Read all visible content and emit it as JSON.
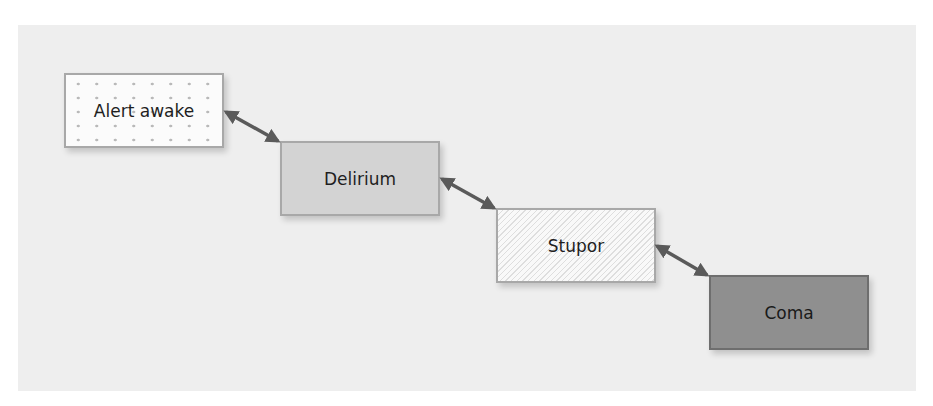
{
  "diagram": {
    "type": "sequential-states",
    "background_color": "#eeeeee",
    "arrow_color": "#5a5a5a",
    "arrow_style": "double-headed",
    "nodes": [
      {
        "id": "alert",
        "label": "Alert awake",
        "fill": "dotted-white"
      },
      {
        "id": "delirium",
        "label": "Delirium",
        "fill": "#d3d3d3"
      },
      {
        "id": "stupor",
        "label": "Stupor",
        "fill": "hatched-white"
      },
      {
        "id": "coma",
        "label": "Coma",
        "fill": "#8f8f8f"
      }
    ],
    "edges": [
      {
        "from": "alert",
        "to": "delirium",
        "bidirectional": true
      },
      {
        "from": "delirium",
        "to": "stupor",
        "bidirectional": true
      },
      {
        "from": "stupor",
        "to": "coma",
        "bidirectional": true
      }
    ]
  }
}
